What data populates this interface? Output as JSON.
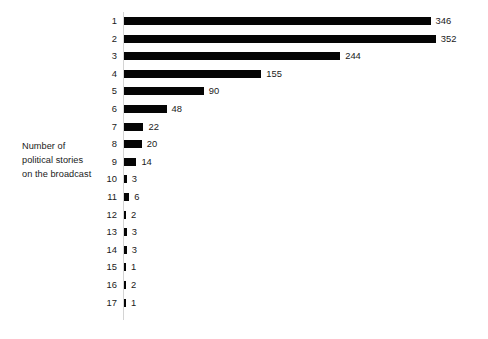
{
  "chart_data": {
    "type": "bar",
    "orientation": "horizontal",
    "title": "",
    "subtitle": "",
    "xlabel": "",
    "ylabel": "Number of political stories on the broadcast",
    "ylabel_lines": [
      "Number of",
      "political stories",
      "on the broadcast"
    ],
    "categories": [
      "1",
      "2",
      "3",
      "4",
      "5",
      "6",
      "7",
      "8",
      "9",
      "10",
      "11",
      "12",
      "13",
      "14",
      "15",
      "16",
      "17"
    ],
    "values": [
      346,
      352,
      244,
      155,
      90,
      48,
      22,
      20,
      14,
      3,
      6,
      2,
      3,
      3,
      1,
      2,
      1
    ],
    "data_labels": [
      "346",
      "352",
      "244",
      "155",
      "90",
      "48",
      "22",
      "20",
      "14",
      "3",
      "6",
      "2",
      "3",
      "3",
      "1",
      "2",
      "1"
    ],
    "xlim": [
      0,
      352
    ],
    "grid": false,
    "legend": null,
    "legend_position": "none",
    "bar_color": "#050505",
    "axis_line_color": "#d4d4d4",
    "text_color": "#1a1a1a",
    "background_color": "#ffffff"
  },
  "rows": [
    {
      "category": "1",
      "value": 346,
      "label": "346"
    },
    {
      "category": "2",
      "value": 352,
      "label": "352"
    },
    {
      "category": "3",
      "value": 244,
      "label": "244"
    },
    {
      "category": "4",
      "value": 155,
      "label": "155"
    },
    {
      "category": "5",
      "value": 90,
      "label": "90"
    },
    {
      "category": "6",
      "value": 48,
      "label": "48"
    },
    {
      "category": "7",
      "value": 22,
      "label": "22"
    },
    {
      "category": "8",
      "value": 20,
      "label": "20"
    },
    {
      "category": "9",
      "value": 14,
      "label": "14"
    },
    {
      "category": "10",
      "value": 3,
      "label": "3"
    },
    {
      "category": "11",
      "value": 6,
      "label": "6"
    },
    {
      "category": "12",
      "value": 2,
      "label": "2"
    },
    {
      "category": "13",
      "value": 3,
      "label": "3"
    },
    {
      "category": "14",
      "value": 3,
      "label": "3"
    },
    {
      "category": "15",
      "value": 1,
      "label": "1"
    },
    {
      "category": "16",
      "value": 2,
      "label": "2"
    },
    {
      "category": "17",
      "value": 1,
      "label": "1"
    }
  ]
}
